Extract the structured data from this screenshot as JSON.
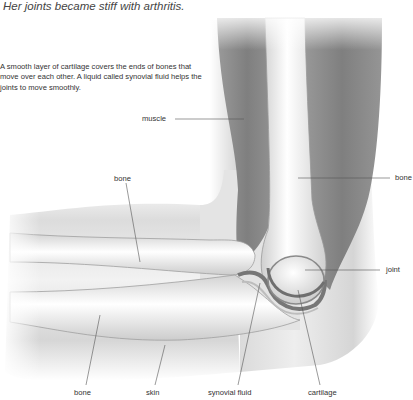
{
  "example_sentence": "Her joints became stiff with arthritis.",
  "caption": "A smooth layer of cartilage covers the ends of bones that move over each other. A liquid called synovial fluid helps the joints to move smoothly.",
  "diagram": {
    "labels": {
      "muscle": "muscle",
      "bone_upper_left": "bone",
      "bone_right": "bone",
      "joint": "joint",
      "bone_bottom": "bone",
      "skin": "skin",
      "synovial_fluid": "synovial fluid",
      "cartilage": "cartilage"
    }
  },
  "colors": {
    "muscle": "#8a8a8a",
    "bone": "#ececec",
    "skin": "#d8d8d8",
    "leader_line": "#555555"
  }
}
